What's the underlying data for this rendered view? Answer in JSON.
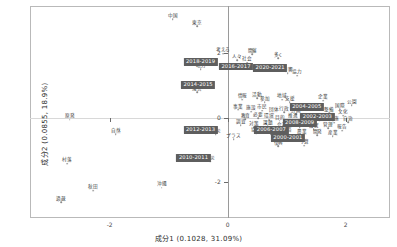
{
  "chart_data": {
    "type": "scatter",
    "title": "",
    "xlabel": "成分1  (0.1028,  31.09%)",
    "ylabel": "成分2  (0.0855,  18.9%)",
    "xlim": [
      -3.35,
      2.75
    ],
    "ylim": [
      -3.1,
      3.45
    ],
    "xticks": [
      -2,
      0,
      2
    ],
    "xticklabels": [
      "-2",
      "0",
      "2"
    ],
    "yticks": [
      -2,
      0,
      2
    ],
    "yticklabels": [
      "-2",
      "0",
      "2"
    ],
    "grid": false,
    "legend": "none",
    "axis_zero_lines": true,
    "series": [
      {
        "name": "年区分 (highlighted supplementary points)",
        "marker": "labelbox",
        "points": [
          {
            "label": "2018-2019",
            "x": -0.46,
            "y": 1.72
          },
          {
            "label": "2016-2017",
            "x": 0.14,
            "y": 1.58
          },
          {
            "label": "2020-2021",
            "x": 0.72,
            "y": 1.52
          },
          {
            "label": "2014-2015",
            "x": -0.5,
            "y": 1.0
          },
          {
            "label": "2012-2013",
            "x": -0.46,
            "y": -0.37
          },
          {
            "label": "2010-2011",
            "x": -0.58,
            "y": -1.25
          },
          {
            "label": "2004-2005",
            "x": 1.34,
            "y": 0.32
          },
          {
            "label": "2002-2003",
            "x": 1.52,
            "y": 0.02
          },
          {
            "label": "2008-2009",
            "x": 1.22,
            "y": -0.18
          },
          {
            "label": "2006-2007",
            "x": 0.74,
            "y": -0.38
          },
          {
            "label": "2000-2001",
            "x": 1.02,
            "y": -0.62
          }
        ]
      },
      {
        "name": "語 (word points)",
        "marker": "dot",
        "points": [
          {
            "label": "中国",
            "x": -0.93,
            "y": 3.04
          },
          {
            "label": "東京",
            "x": -0.52,
            "y": 2.82
          },
          {
            "label": "考える",
            "x": -0.08,
            "y": 1.98
          },
          {
            "label": "開催",
            "x": 0.42,
            "y": 1.96
          },
          {
            "label": "多く",
            "x": 0.86,
            "y": 1.84
          },
          {
            "label": "地方",
            "x": -0.46,
            "y": 1.5
          },
          {
            "label": "人々",
            "x": 0.16,
            "y": 1.78
          },
          {
            "label": "社会",
            "x": 0.33,
            "y": 1.7
          },
          {
            "label": "影響",
            "x": 1.02,
            "y": 1.38
          },
          {
            "label": "協力",
            "x": 1.18,
            "y": 1.3
          },
          {
            "label": "運営",
            "x": -0.52,
            "y": 0.78
          },
          {
            "label": "情報",
            "x": 0.25,
            "y": 0.55
          },
          {
            "label": "活動",
            "x": 0.5,
            "y": 0.6
          },
          {
            "label": "参加",
            "x": 0.63,
            "y": 0.48
          },
          {
            "label": "地域",
            "x": 0.92,
            "y": 0.55
          },
          {
            "label": "支援",
            "x": 1.05,
            "y": 0.48
          },
          {
            "label": "企業",
            "x": 1.62,
            "y": 0.52
          },
          {
            "label": "公園",
            "x": 2.1,
            "y": 0.38
          },
          {
            "label": "国際",
            "x": 1.9,
            "y": 0.26
          },
          {
            "label": "事業",
            "x": 0.18,
            "y": 0.24
          },
          {
            "label": "施設",
            "x": 0.4,
            "y": 0.18
          },
          {
            "label": "市民",
            "x": 0.58,
            "y": 0.22
          },
          {
            "label": "団体",
            "x": 0.78,
            "y": 0.12
          },
          {
            "label": "行政",
            "x": 0.96,
            "y": 0.16
          },
          {
            "label": "計画",
            "x": 1.16,
            "y": 0.1
          },
          {
            "label": "整備",
            "x": 1.72,
            "y": 0.14
          },
          {
            "label": "文化",
            "x": 1.96,
            "y": 0.06
          },
          {
            "label": "教育",
            "x": 0.3,
            "y": -0.04
          },
          {
            "label": "必要",
            "x": 0.52,
            "y": -0.02
          },
          {
            "label": "環境",
            "x": 0.7,
            "y": -0.06
          },
          {
            "label": "目的",
            "x": 0.88,
            "y": -0.1
          },
          {
            "label": "推進",
            "x": 1.1,
            "y": -0.06
          },
          {
            "label": "検討",
            "x": 1.34,
            "y": -0.12
          },
          {
            "label": "利用",
            "x": 1.56,
            "y": -0.08
          },
          {
            "label": "実施",
            "x": 1.8,
            "y": -0.16
          },
          {
            "label": "自治",
            "x": 2.04,
            "y": -0.14
          },
          {
            "label": "調査",
            "x": 0.22,
            "y": -0.24
          },
          {
            "label": "対策",
            "x": 0.44,
            "y": -0.3
          },
          {
            "label": "課題",
            "x": 0.68,
            "y": -0.26
          },
          {
            "label": "会議",
            "x": 0.92,
            "y": -0.34
          },
          {
            "label": "提供",
            "x": 1.22,
            "y": -0.3
          },
          {
            "label": "設置",
            "x": 1.46,
            "y": -0.36
          },
          {
            "label": "管理",
            "x": 1.7,
            "y": -0.32
          },
          {
            "label": "報告",
            "x": 1.94,
            "y": -0.4
          },
          {
            "label": "防災",
            "x": -0.2,
            "y": -0.52
          },
          {
            "label": "プラス",
            "x": 0.1,
            "y": -0.66
          },
          {
            "label": "協議",
            "x": 0.48,
            "y": -0.48
          },
          {
            "label": "制度",
            "x": 0.74,
            "y": -0.52
          },
          {
            "label": "経済",
            "x": 1.0,
            "y": -0.5
          },
          {
            "label": "農業",
            "x": 1.26,
            "y": -0.56
          },
          {
            "label": "開発",
            "x": 1.52,
            "y": -0.54
          },
          {
            "label": "産業",
            "x": 1.78,
            "y": -0.58
          },
          {
            "label": "復興",
            "x": 0.86,
            "y": -0.88
          },
          {
            "label": "予算",
            "x": 1.3,
            "y": -0.86
          },
          {
            "label": "震災",
            "x": -0.3,
            "y": -1.34
          },
          {
            "label": "原発",
            "x": -2.68,
            "y": -0.06
          },
          {
            "label": "自然",
            "x": -1.9,
            "y": -0.52
          },
          {
            "label": "村落",
            "x": -2.72,
            "y": -1.42
          },
          {
            "label": "秋田",
            "x": -2.28,
            "y": -2.26
          },
          {
            "label": "過疎",
            "x": -2.82,
            "y": -2.62
          },
          {
            "label": "沖縄",
            "x": -1.12,
            "y": -2.16
          }
        ]
      }
    ]
  }
}
